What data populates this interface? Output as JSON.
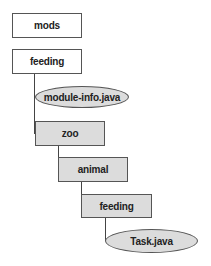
{
  "diagram": {
    "type": "directory-tree",
    "nodes": [
      {
        "id": "mods",
        "label": "mods",
        "kind": "folder",
        "fill": "#ffffff"
      },
      {
        "id": "feeding_module",
        "label": "feeding",
        "kind": "folder",
        "fill": "#ffffff"
      },
      {
        "id": "module_info",
        "label": "module-info.java",
        "kind": "file",
        "fill": "#dcdcdc"
      },
      {
        "id": "zoo",
        "label": "zoo",
        "kind": "package",
        "fill": "#dcdcdc"
      },
      {
        "id": "animal",
        "label": "animal",
        "kind": "package",
        "fill": "#dcdcdc"
      },
      {
        "id": "feeding_pkg",
        "label": "feeding",
        "kind": "package",
        "fill": "#dcdcdc"
      },
      {
        "id": "task_java",
        "label": "Task.java",
        "kind": "file",
        "fill": "#dcdcdc"
      }
    ],
    "edges": [
      {
        "from": "mods",
        "to": "feeding_module"
      },
      {
        "from": "feeding_module",
        "to": "module_info"
      },
      {
        "from": "feeding_module",
        "to": "zoo"
      },
      {
        "from": "zoo",
        "to": "animal"
      },
      {
        "from": "animal",
        "to": "feeding_pkg"
      },
      {
        "from": "feeding_pkg",
        "to": "task_java"
      }
    ]
  }
}
